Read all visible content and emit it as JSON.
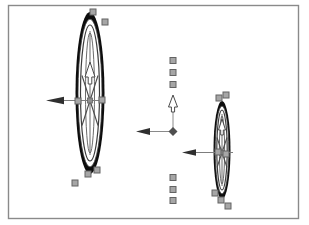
{
  "canvas": {
    "width": 309,
    "height": 225,
    "background": "#ffffff",
    "frame": {
      "x": 8,
      "y": 5,
      "width": 290,
      "height": 213
    }
  },
  "colors": {
    "frame_border": "#8a8a8a",
    "tire": "#0d0d0d",
    "rim_stroke": "#333333",
    "mid_ellipse": "#3d3d3d",
    "lens_ellipse": "#5a5a5a",
    "axis_line": "#6a6a6a",
    "spoke": "#4a4a4a",
    "arrow_shaft": "#7d7d7d",
    "arrow_fill": "#2f2f2f",
    "arrow_outline": "#4a4a4a",
    "up_arrow_fill": "#ffffff",
    "handle_fill": "#a6a6a6",
    "handle_stroke": "#636363",
    "hub_fill": "#8f8f8f",
    "gizmo_line": "#8a8a8a",
    "gizmo_hub": "#4f4f4f"
  },
  "wheels": [
    {
      "id": "left-wheel",
      "cx": 90,
      "cy": 93,
      "outer_rx": 14.5,
      "outer_ry": 81,
      "rim_rx": 12,
      "rim_ry": 74,
      "mid_rx": 9.5,
      "mid_ry": 68,
      "lens_rx": 4.5,
      "lens_ry": 60,
      "hub_y": 100.5,
      "hub_size": 5,
      "spoke_dx": 8,
      "spoke_dy": 25,
      "up_arrow": {
        "cx": 90,
        "tip_y": 62,
        "base_y": 77,
        "half_w": 5,
        "tail_y": 84,
        "tail_half_w": 1.8
      },
      "left_arrow": {
        "y": 100.5,
        "tip_x": 46,
        "head_len": 18,
        "head_half_h": 3.8,
        "shaft_to_x": 104
      }
    },
    {
      "id": "right-wheel",
      "cx": 222,
      "cy": 150,
      "outer_rx": 8.5,
      "outer_ry": 49,
      "rim_rx": 6.8,
      "rim_ry": 44,
      "mid_rx": 5.2,
      "mid_ry": 40,
      "lens_rx": 2.6,
      "lens_ry": 34,
      "hub_y": 152.5,
      "hub_size": 4.5,
      "spoke_dx": 5,
      "spoke_dy": 15,
      "up_arrow": {
        "cx": 222,
        "tip_y": 119,
        "base_y": 130,
        "half_w": 3.5,
        "tail_y": 135,
        "tail_half_w": 1.3
      },
      "left_arrow": {
        "y": 152.5,
        "tip_x": 182,
        "head_len": 14,
        "head_half_h": 3.2,
        "shaft_to_x": 233
      }
    }
  ],
  "gizmo": {
    "cx": 173,
    "cy": 131.5,
    "hub_r": 4.5,
    "up_line_to_y": 110,
    "up_arrow": {
      "cx": 173,
      "tip_y": 95,
      "base_y": 107,
      "half_w": 4.5,
      "tail_y": 112,
      "tail_half_w": 1.6
    },
    "left_line_to_x": 150,
    "left_arrow": {
      "y": 131.5,
      "tip_x": 136,
      "head_len": 14,
      "head_half_h": 3.5
    }
  },
  "handles": {
    "size": 6,
    "column_top": [
      [
        173,
        60.5
      ],
      [
        173,
        72.5
      ],
      [
        173,
        84.5
      ]
    ],
    "column_bottom": [
      [
        173,
        177.5
      ],
      [
        173,
        189.5
      ],
      [
        173,
        200.5
      ]
    ],
    "left_wheel": [
      [
        93,
        12
      ],
      [
        105,
        22
      ],
      [
        78,
        101
      ],
      [
        102,
        100
      ],
      [
        97,
        170
      ],
      [
        88,
        174
      ],
      [
        75,
        183
      ]
    ],
    "right_wheel": [
      [
        219,
        98
      ],
      [
        226,
        95
      ],
      [
        218,
        152
      ],
      [
        226,
        154
      ],
      [
        215,
        193
      ],
      [
        221,
        200
      ],
      [
        228,
        206
      ]
    ]
  }
}
